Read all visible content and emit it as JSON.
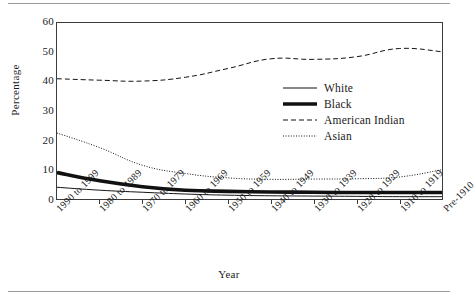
{
  "chart_data": {
    "type": "line",
    "title": "",
    "xlabel": "Year",
    "ylabel": "Percentage",
    "ylim": [
      0,
      60
    ],
    "yticks": [
      0,
      10,
      20,
      30,
      40,
      50,
      60
    ],
    "grid": false,
    "legend_position": "center-right",
    "categories": [
      "1990 to 1999",
      "1980 to 1989",
      "1970 to 1979",
      "1960 to 1969",
      "1950 to 1959",
      "1940 to 1949",
      "1930 to 1939",
      "1920 to 1929",
      "1910 to 1919",
      "Pre-1910"
    ],
    "series": [
      {
        "name": "White",
        "style": "solid-thin",
        "values": [
          4.0,
          3.0,
          2.3,
          1.7,
          1.3,
          1.1,
          1.0,
          0.9,
          0.8,
          0.8
        ]
      },
      {
        "name": "Black",
        "style": "solid-thick",
        "values": [
          9.0,
          6.2,
          4.2,
          3.0,
          2.6,
          2.4,
          2.3,
          2.2,
          2.2,
          2.2
        ]
      },
      {
        "name": "American Indian",
        "style": "dashed",
        "values": [
          41.0,
          40.5,
          40.2,
          41.5,
          44.5,
          47.8,
          47.6,
          48.5,
          51.3,
          50.2
        ]
      },
      {
        "name": "Asian",
        "style": "dotted",
        "values": [
          22.5,
          17.5,
          11.5,
          8.7,
          7.2,
          6.7,
          6.8,
          6.9,
          7.5,
          10.0
        ]
      }
    ]
  },
  "axes": {
    "y_title": "Percentage",
    "x_title": "Year",
    "y_tick_labels": [
      "0",
      "10",
      "20",
      "30",
      "40",
      "50",
      "60"
    ]
  },
  "legend": {
    "items": [
      {
        "label": "White"
      },
      {
        "label": "Black"
      },
      {
        "label": "American Indian"
      },
      {
        "label": "Asian"
      }
    ]
  }
}
